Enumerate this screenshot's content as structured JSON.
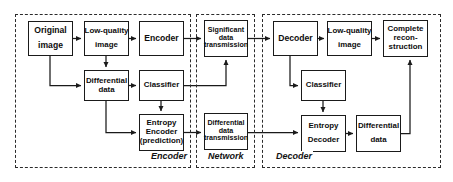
{
  "diagram": {
    "regions": [
      {
        "id": "encoder-region",
        "label": "Encoder",
        "x": 15,
        "y": 14,
        "w": 176,
        "h": 154,
        "label_x": 150,
        "label_y": 151
      },
      {
        "id": "network-region",
        "label": "Network",
        "x": 196,
        "y": 14,
        "w": 59,
        "h": 154,
        "label_x": 207,
        "label_y": 151
      },
      {
        "id": "decoder-region",
        "label": "Decoder",
        "x": 262,
        "y": 14,
        "w": 179,
        "h": 154,
        "label_x": 275,
        "label_y": 151
      }
    ],
    "nodes": [
      {
        "id": "original-image",
        "lines": [
          "Original",
          "image"
        ],
        "x": 28,
        "y": 21,
        "w": 45,
        "h": 35,
        "size": "sz-9",
        "spaced": true
      },
      {
        "id": "low-quality-image-encoder",
        "lines": [
          "Low-quality",
          "image"
        ],
        "x": 84,
        "y": 21,
        "w": 45,
        "h": 35,
        "size": "sz-8",
        "spaced": true
      },
      {
        "id": "encoder",
        "lines": [
          "Encoder"
        ],
        "x": 139,
        "y": 21,
        "w": 45,
        "h": 35,
        "size": "sz-9",
        "spaced": false
      },
      {
        "id": "significant-data-transmission",
        "lines": [
          "Significant",
          "data",
          "transmission"
        ],
        "x": 204,
        "y": 20,
        "w": 44,
        "h": 37,
        "size": "sz-7",
        "spaced": false
      },
      {
        "id": "decoder",
        "lines": [
          "Decoder"
        ],
        "x": 273,
        "y": 21,
        "w": 45,
        "h": 35,
        "size": "sz-9",
        "spaced": false
      },
      {
        "id": "low-quality-image-decoder",
        "lines": [
          "Low-quality",
          "image"
        ],
        "x": 327,
        "y": 21,
        "w": 45,
        "h": 35,
        "size": "sz-8",
        "spaced": true
      },
      {
        "id": "complete-reconstruction",
        "lines": [
          "Complete",
          "recon-",
          "struction"
        ],
        "x": 383,
        "y": 20,
        "w": 45,
        "h": 37,
        "size": "sz-8",
        "spaced": false
      },
      {
        "id": "differential-data-encoder",
        "lines": [
          "Differential",
          "data"
        ],
        "x": 84,
        "y": 70,
        "w": 45,
        "h": 31,
        "size": "sz-8",
        "spaced": false
      },
      {
        "id": "classifier-encoder",
        "lines": [
          "Classifier"
        ],
        "x": 139,
        "y": 70,
        "w": 45,
        "h": 31,
        "size": "sz-8",
        "spaced": false
      },
      {
        "id": "classifier-decoder",
        "lines": [
          "Classifier"
        ],
        "x": 301,
        "y": 70,
        "w": 45,
        "h": 31,
        "size": "sz-8",
        "spaced": false
      },
      {
        "id": "entropy-encoder-prediction",
        "lines": [
          "Entropy",
          "Encoder",
          "(prediction)"
        ],
        "x": 139,
        "y": 114,
        "w": 45,
        "h": 37,
        "size": "sz-8",
        "spaced": false
      },
      {
        "id": "differential-data-transmission",
        "lines": [
          "Differential",
          "data",
          "transmission"
        ],
        "x": 204,
        "y": 113,
        "w": 44,
        "h": 37,
        "size": "sz-7",
        "spaced": false
      },
      {
        "id": "entropy-decoder",
        "lines": [
          "Entropy",
          "Decoder"
        ],
        "x": 301,
        "y": 115,
        "w": 45,
        "h": 37,
        "size": "sz-8",
        "spaced": true
      },
      {
        "id": "differential-data-decoder",
        "lines": [
          "Differential",
          "data"
        ],
        "x": 356,
        "y": 115,
        "w": 45,
        "h": 37,
        "size": "sz-8",
        "spaced": true
      }
    ],
    "connectors": [
      {
        "id": "original-to-lowquality",
        "path": "M73,38.5 L81,38.5",
        "arrow": true
      },
      {
        "id": "lowquality-to-encoder",
        "path": "M129,38.5 L136,38.5",
        "arrow": true
      },
      {
        "id": "encoder-to-significant",
        "path": "M184,38.5 L201,38.5",
        "arrow": true
      },
      {
        "id": "significant-to-decoder",
        "path": "M248,38.5 L270,38.5",
        "arrow": true
      },
      {
        "id": "decoder-to-lowquality2",
        "path": "M318,38.5 L324,38.5",
        "arrow": true
      },
      {
        "id": "lowquality2-to-complete",
        "path": "M372,38.5 L380,38.5",
        "arrow": true
      },
      {
        "id": "original-to-differential",
        "path": "M50,56 L50,85.5 L81,85.5",
        "arrow": true
      },
      {
        "id": "lowquality-to-differential",
        "path": "M106,56 L106,67",
        "arrow": true
      },
      {
        "id": "differential-to-classifier",
        "path": "M129,85.5 L136,85.5",
        "arrow": true
      },
      {
        "id": "classifier-to-entropy",
        "path": "M161,101 L161,111",
        "arrow": true
      },
      {
        "id": "differential-to-entropy",
        "path": "M106,101 L106,132.5 L136,132.5",
        "arrow": true
      },
      {
        "id": "classifier-to-significant",
        "path": "M184,85.5 L226,85.5 L226,60",
        "arrow": true
      },
      {
        "id": "entropy-to-diffdatatrans",
        "path": "M184,132.5 L201,132.5",
        "arrow": true
      },
      {
        "id": "diffdatatrans-to-entropydecoder",
        "path": "M248,132.5 L298,132.5",
        "arrow": true
      },
      {
        "id": "decoder-to-classifier2",
        "path": "M290,56 L290,85.5 L298,85.5",
        "arrow": true
      },
      {
        "id": "classifier2-to-entropydecoder",
        "path": "M323,101 L323,112",
        "arrow": true
      },
      {
        "id": "entropydecoder-to-diffdata2",
        "path": "M346,133.5 L353,133.5",
        "arrow": true
      },
      {
        "id": "diffdata2-to-complete",
        "path": "M401,133.5 L410,133.5 L410,60",
        "arrow": true
      }
    ]
  }
}
